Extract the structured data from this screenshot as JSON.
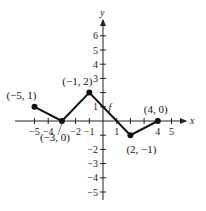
{
  "chart_data": {
    "type": "line",
    "title": "",
    "xlabel": "x",
    "ylabel": "y",
    "function_label": "f",
    "xlim": [
      -5,
      5
    ],
    "ylim": [
      -5,
      6
    ],
    "x_ticks": [
      -5,
      -4,
      -3,
      -2,
      -1,
      1,
      2,
      3,
      4,
      5
    ],
    "x_tick_labels": [
      "−5",
      "−4",
      "",
      "−2",
      "−1",
      "1",
      "",
      "",
      "4",
      "5"
    ],
    "y_ticks": [
      -5,
      -4,
      -3,
      -2,
      -1,
      1,
      2,
      3,
      4,
      5,
      6
    ],
    "y_tick_labels": [
      "−5",
      "−4",
      "−3",
      "−2",
      "",
      "1",
      "",
      "3",
      "4",
      "5",
      "6"
    ],
    "grid": false,
    "series": [
      {
        "name": "f",
        "x": [
          -5,
          -3,
          -1,
          2,
          4
        ],
        "y": [
          1,
          0,
          2,
          -1,
          0
        ]
      }
    ],
    "annotations": [
      {
        "text": "(−5, 1)",
        "x": -5,
        "y": 1
      },
      {
        "text": "(−3, 0)",
        "x": -3,
        "y": 0
      },
      {
        "text": "(−1, 2)",
        "x": -1,
        "y": 2
      },
      {
        "text": "(2, −1)",
        "x": 2,
        "y": -1
      },
      {
        "text": "(4, 0)",
        "x": 4,
        "y": 0
      }
    ]
  }
}
